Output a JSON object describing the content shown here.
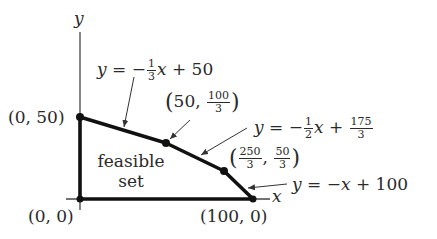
{
  "diagram": {
    "axes": {
      "x_label": "x",
      "y_label": "y"
    },
    "region_label": {
      "line1": "feasible",
      "line2": "set"
    },
    "vertices": [
      {
        "id": "origin",
        "label": "(0, 0)",
        "x": 0,
        "y": 0
      },
      {
        "id": "y_intercept",
        "label": "(0, 50)",
        "x": 0,
        "y": 50
      },
      {
        "id": "v1",
        "label_x": "50",
        "label_y_num": "100",
        "label_y_den": "3",
        "x": 50,
        "y": 33.33
      },
      {
        "id": "v2",
        "label_x_num": "250",
        "label_x_den": "3",
        "label_y_num": "50",
        "label_y_den": "3",
        "x": 83.33,
        "y": 16.67
      },
      {
        "id": "x_intercept",
        "label": "(100, 0)",
        "x": 100,
        "y": 0
      }
    ],
    "constraints": [
      {
        "id": "c1",
        "lhs": "y",
        "eq": "=",
        "sign": "−",
        "coef_num": "1",
        "coef_den": "3",
        "var": "x",
        "plus": "+",
        "const": "50"
      },
      {
        "id": "c2",
        "lhs": "y",
        "eq": "=",
        "sign": "−",
        "coef_num": "1",
        "coef_den": "2",
        "var": "x",
        "plus": "+",
        "const_num": "175",
        "const_den": "3"
      },
      {
        "id": "c3",
        "lhs": "y",
        "eq": "=",
        "sign": "−",
        "var": "x",
        "plus": "+",
        "const": "100"
      }
    ],
    "colors": {
      "stroke": "#111111",
      "text": "#2a2a2a",
      "axis": "#444444"
    }
  }
}
